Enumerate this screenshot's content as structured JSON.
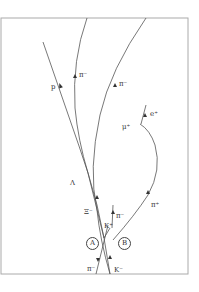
{
  "figure": {
    "type": "bubble-chamber-track-diagram",
    "background": "#ffffff",
    "frame_color": "#aaaaaa",
    "track_color": "#555555",
    "labels": {
      "p": "p",
      "pi_minus_1": "π⁻",
      "pi_minus_2": "π⁻",
      "mu_plus": "μ⁺",
      "e_plus": "e⁺",
      "lambda": "Λ",
      "xi_minus": "Ξ⁻",
      "pi_minus_3": "π⁻",
      "k_plus": "K⁺",
      "pi_plus": "π⁺",
      "vertex_a": "A",
      "vertex_b": "B",
      "pi_minus_beam": "π⁻",
      "k_minus_beam": "K⁻"
    }
  }
}
